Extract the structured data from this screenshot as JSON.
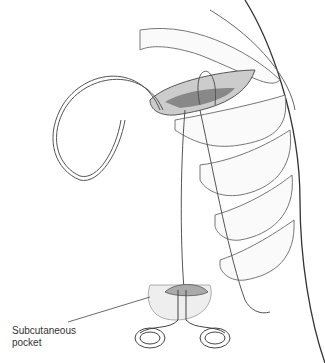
{
  "figure": {
    "labels": [
      {
        "text_line1": "Subcutaneous",
        "text_line2": "pocket"
      }
    ],
    "colors": {
      "line": "#555555",
      "tissue": "#bbbbbb",
      "shade": "#e8e8e8"
    }
  }
}
